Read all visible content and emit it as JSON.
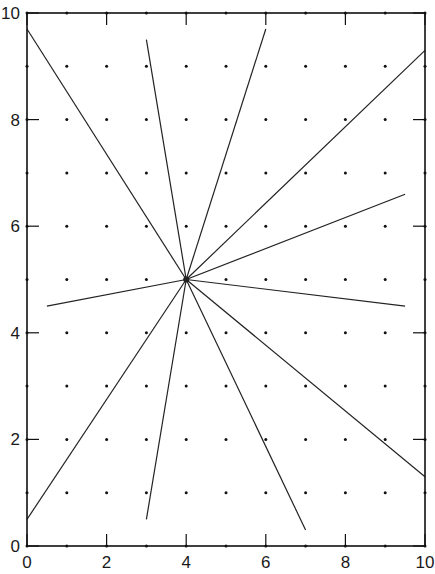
{
  "chart_data": {
    "type": "line",
    "title": "",
    "xlabel": "",
    "ylabel": "",
    "xlim": [
      0,
      10
    ],
    "ylim": [
      0,
      10
    ],
    "x_ticks": [
      0,
      2,
      4,
      6,
      8,
      10
    ],
    "y_ticks": [
      0,
      2,
      4,
      6,
      8,
      10
    ],
    "grid": "dots at integer points",
    "legend": null,
    "center": [
      4,
      5
    ],
    "series": [
      {
        "name": "ray-1",
        "x": [
          4,
          0
        ],
        "y": [
          5,
          9.7
        ]
      },
      {
        "name": "ray-2",
        "x": [
          4,
          3
        ],
        "y": [
          5,
          9.5
        ]
      },
      {
        "name": "ray-3",
        "x": [
          4,
          6
        ],
        "y": [
          5,
          9.7
        ]
      },
      {
        "name": "ray-4",
        "x": [
          4,
          10
        ],
        "y": [
          5,
          9.3
        ]
      },
      {
        "name": "ray-5",
        "x": [
          4,
          9.5
        ],
        "y": [
          5,
          6.6
        ]
      },
      {
        "name": "ray-6",
        "x": [
          4,
          9.5
        ],
        "y": [
          5,
          4.5
        ]
      },
      {
        "name": "ray-7",
        "x": [
          4,
          10
        ],
        "y": [
          5,
          1.3
        ]
      },
      {
        "name": "ray-8",
        "x": [
          4,
          7
        ],
        "y": [
          5,
          0.3
        ]
      },
      {
        "name": "ray-9",
        "x": [
          4,
          3
        ],
        "y": [
          5,
          0.5
        ]
      },
      {
        "name": "ray-10",
        "x": [
          4,
          0
        ],
        "y": [
          5,
          0.5
        ]
      },
      {
        "name": "ray-11",
        "x": [
          4,
          0.5
        ],
        "y": [
          5,
          4.5
        ]
      }
    ]
  },
  "style": {
    "line_color": "#222222",
    "axis_color": "#111111",
    "dot_color": "#111111"
  }
}
